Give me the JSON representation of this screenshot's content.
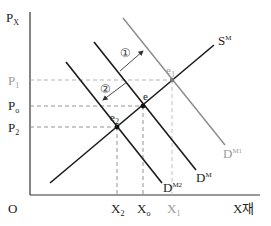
{
  "diagram": {
    "colors": {
      "axis": "#333333",
      "curve_dark": "#1a1a1a",
      "curve_gray": "#8a8a8a",
      "dashed": "#9a9a9a",
      "label_gray": "#9a9a9a"
    },
    "axes": {
      "y_label": "P",
      "y_label_sub": "X",
      "x_label": "X재",
      "origin_label": "O"
    },
    "price_labels": [
      {
        "id": "P1",
        "text": "P",
        "sub": "1",
        "gray": true
      },
      {
        "id": "Po",
        "text": "P",
        "sub": "o",
        "gray": false
      },
      {
        "id": "P2",
        "text": "P",
        "sub": "2",
        "gray": false
      }
    ],
    "quantity_labels": [
      {
        "id": "X2",
        "text": "X",
        "sub": "2",
        "gray": false
      },
      {
        "id": "Xo",
        "text": "X",
        "sub": "o",
        "gray": false
      },
      {
        "id": "X1",
        "text": "X",
        "sub": "1",
        "gray": true
      }
    ],
    "curves": {
      "supply": {
        "text": "S",
        "sup": "M"
      },
      "demand": {
        "text": "D",
        "sup": "M"
      },
      "demand1": {
        "text": "D",
        "sup": "M1"
      },
      "demand2": {
        "text": "D",
        "sup": "M2"
      }
    },
    "equilibria": {
      "e": {
        "text": "e",
        "sub": ""
      },
      "e1": {
        "text": "e",
        "sub": "1"
      },
      "e2": {
        "text": "e",
        "sub": "2"
      }
    },
    "shift_markers": {
      "shift1": "①",
      "shift2": "②"
    }
  }
}
